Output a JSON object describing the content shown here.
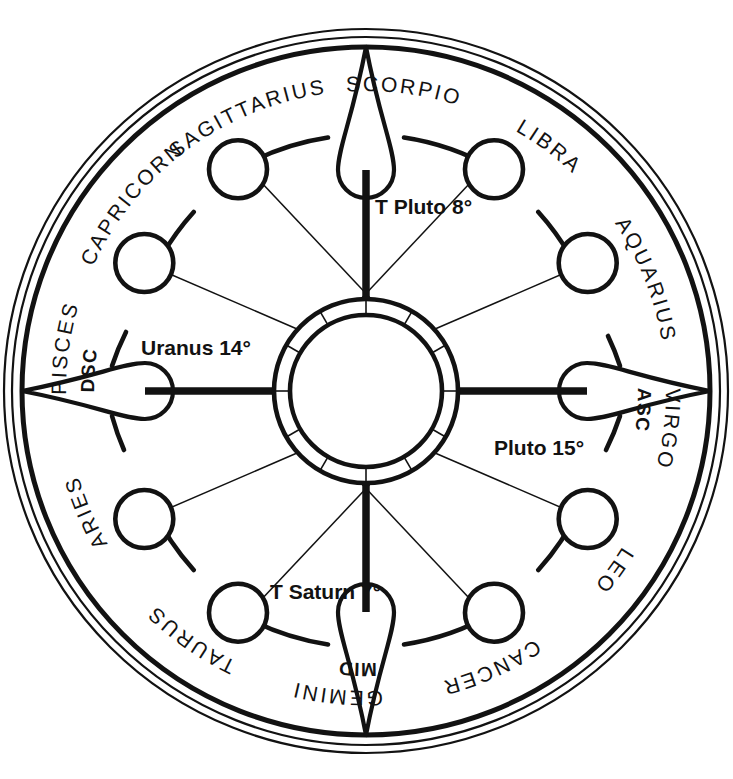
{
  "chart": {
    "background_color": "#ffffff",
    "line_color": "#121212",
    "center": {
      "x": 366,
      "y": 391
    },
    "radii": {
      "rim_outer": 362,
      "rim_middle": 354,
      "rim_inner": 344,
      "node_ring": 256,
      "node_circle": 29,
      "hub_outer": 92,
      "hub_inner": 76,
      "hub_core": 66
    }
  },
  "signs": [
    {
      "name": "CAPRICORN",
      "angle_deg": 285,
      "reversed": false
    },
    {
      "name": "SAGITTARIUS",
      "angle_deg": 255,
      "reversed": false
    },
    {
      "name": "SCORPIO",
      "angle_deg": 225,
      "reversed": false
    },
    {
      "name": "LIBRA",
      "angle_deg": 195,
      "reversed": false
    },
    {
      "name": "VIRGO",
      "angle_deg": 165,
      "reversed": true
    },
    {
      "name": "LEO",
      "angle_deg": 135,
      "reversed": true
    },
    {
      "name": "CANCER",
      "angle_deg": 105,
      "reversed": true
    },
    {
      "name": "GEMINI",
      "angle_deg": 75,
      "reversed": true
    },
    {
      "name": "TAURUS",
      "angle_deg": 45,
      "reversed": true
    },
    {
      "name": "ARIES",
      "angle_deg": 15,
      "reversed": true
    },
    {
      "name": "PISCES",
      "angle_deg": 345,
      "reversed": false
    },
    {
      "name": "AQUARIUS",
      "angle_deg": 315,
      "reversed": false
    }
  ],
  "angles": [
    {
      "label": "ASC",
      "sign": "VIRGO",
      "angle_deg": 172,
      "reversed": true
    },
    {
      "label": "DSC",
      "sign": "PISCES",
      "angle_deg": 352,
      "reversed": false
    },
    {
      "label": "MID",
      "sign": "GEMINI",
      "angle_deg": 82,
      "reversed": true
    }
  ],
  "planets": [
    {
      "name": "T Pluto 8",
      "label": "T Pluto 8°",
      "x": 375,
      "y": 214
    },
    {
      "name": "Uranus 14",
      "label": "Uranus 14°",
      "x": 141,
      "y": 355
    },
    {
      "name": "Pluto 15",
      "label": "Pluto 15°",
      "x": 494,
      "y": 455
    },
    {
      "name": "T Saturn 7",
      "label": "T Saturn 7°",
      "x": 270,
      "y": 599
    }
  ],
  "axes": [
    {
      "name": "midheaven-axis",
      "orientation": "vertical"
    },
    {
      "name": "ascendant-axis",
      "orientation": "horizontal"
    }
  ],
  "spears": [
    {
      "name": "spear-top",
      "angle_deg": 270
    },
    {
      "name": "spear-bottom",
      "angle_deg": 90
    },
    {
      "name": "spear-left",
      "angle_deg": 180
    },
    {
      "name": "spear-right",
      "angle_deg": 0
    }
  ],
  "house_nodes": [
    {
      "angle_deg": 300
    },
    {
      "angle_deg": 330
    },
    {
      "angle_deg": 30
    },
    {
      "angle_deg": 60
    },
    {
      "angle_deg": 120
    },
    {
      "angle_deg": 150
    },
    {
      "angle_deg": 210
    },
    {
      "angle_deg": 240
    }
  ]
}
